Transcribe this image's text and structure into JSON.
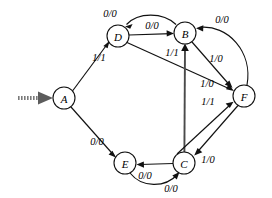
{
  "diagram": {
    "notation": "input/output",
    "stroke_color": "#111111",
    "start_marker_color": "#7a7a7a"
  },
  "states": [
    {
      "id": "A",
      "label": "A",
      "cx": 64,
      "cy": 98,
      "r": 11,
      "is_start": true
    },
    {
      "id": "D",
      "label": "D",
      "cx": 118,
      "cy": 36,
      "r": 11,
      "is_start": false
    },
    {
      "id": "B",
      "label": "B",
      "cx": 185,
      "cy": 33,
      "r": 11,
      "is_start": false
    },
    {
      "id": "F",
      "label": "F",
      "cx": 244,
      "cy": 96,
      "r": 11,
      "is_start": false
    },
    {
      "id": "E",
      "label": "E",
      "cx": 125,
      "cy": 163,
      "r": 11,
      "is_start": false
    },
    {
      "id": "C",
      "label": "C",
      "cx": 184,
      "cy": 163,
      "r": 11,
      "is_start": false
    }
  ],
  "transitions": [
    {
      "id": "a-d",
      "from": "A",
      "to": "D",
      "label": "1/1",
      "lx": 99,
      "ly": 57
    },
    {
      "id": "a-e",
      "from": "A",
      "to": "E",
      "label": "0/0",
      "lx": 97,
      "ly": 141
    },
    {
      "id": "d-b",
      "from": "D",
      "to": "B",
      "label": "0/0",
      "lx": 152,
      "ly": 25
    },
    {
      "id": "b-d",
      "from": "B",
      "to": "D",
      "label": "0/0",
      "lx": 110,
      "ly": 13
    },
    {
      "id": "d-f",
      "from": "D",
      "to": "F",
      "label": "1/0",
      "lx": 207,
      "ly": 83
    },
    {
      "id": "b-f",
      "from": "B",
      "to": "F",
      "label": "1/0",
      "lx": 216,
      "ly": 58
    },
    {
      "id": "f-b",
      "from": "F",
      "to": "B",
      "label": "0/0",
      "lx": 222,
      "ly": 19
    },
    {
      "id": "c-b",
      "from": "C",
      "to": "B",
      "label": "1/1",
      "lx": 172,
      "ly": 52
    },
    {
      "id": "c-f",
      "from": "C",
      "to": "F",
      "label": "1/1",
      "lx": 208,
      "ly": 101
    },
    {
      "id": "f-c",
      "from": "F",
      "to": "C",
      "label": "1/0",
      "lx": 208,
      "ly": 159
    },
    {
      "id": "c-e",
      "from": "C",
      "to": "E",
      "label": "0/0",
      "lx": 145,
      "ly": 175
    },
    {
      "id": "e-c",
      "from": "E",
      "to": "C",
      "label": "0/0",
      "lx": 171,
      "ly": 188
    }
  ],
  "start_marker": {
    "name": "initial-state-arrow",
    "target_state": "A"
  }
}
